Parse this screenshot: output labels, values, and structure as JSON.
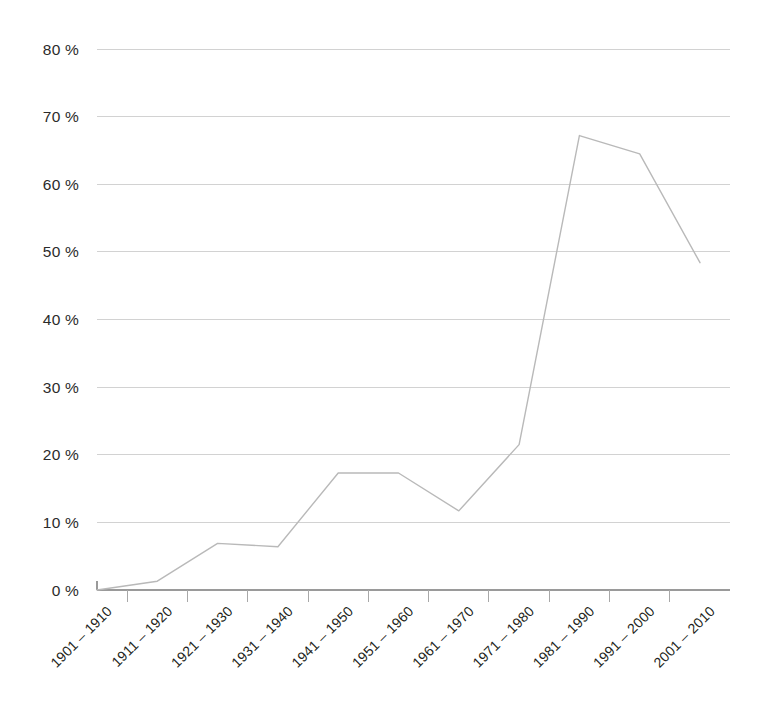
{
  "chart_data": {
    "type": "line",
    "title": "",
    "subtitle": "",
    "xlabel": "",
    "ylabel": "",
    "grid": true,
    "legend": false,
    "legend_position": "none",
    "line_color": "#b9b9b9",
    "grid_color": "#d2d2d2",
    "axis_color": "#9a9a9a",
    "text_color": "#231f20",
    "background": "#ffffff",
    "ylim": [
      0,
      80
    ],
    "ytick_step": 10,
    "value_suffix": "%",
    "ytick_labels": [
      "80 %",
      "70 %",
      "60 %",
      "50 %",
      "40 %",
      "30 %",
      "20 %",
      "10 %",
      "0 %"
    ],
    "ytick_values": [
      80,
      70,
      60,
      50,
      40,
      30,
      20,
      10,
      0
    ],
    "categories": [
      "1901 – 1910",
      "1911 – 1920",
      "1921 – 1930",
      "1931 – 1940",
      "1941 – 1950",
      "1951 – 1960",
      "1961 – 1970",
      "1971 – 1980",
      "1981 – 1990",
      "1991 – 2000",
      "2001 – 2010"
    ],
    "series": [
      {
        "name": "share",
        "values": [
          0.0,
          1.3,
          6.9,
          6.4,
          17.3,
          17.3,
          11.7,
          21.5,
          67.2,
          64.5,
          48.4
        ]
      }
    ]
  }
}
